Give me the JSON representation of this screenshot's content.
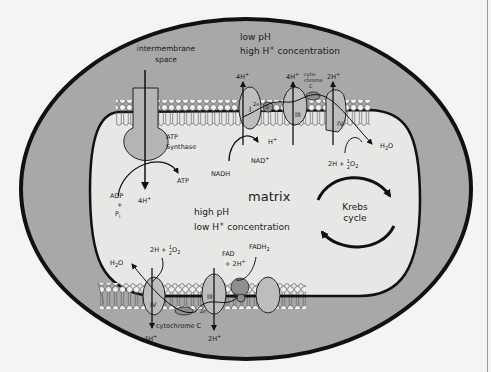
{
  "diagram": {
    "colors": {
      "background": "#f4f4f2",
      "outer_compartment": "#a8a8a8",
      "matrix": "#e6e6e4",
      "membrane_outline": "#111111",
      "protein_fill": "#bdbdbd",
      "protein_dark": "#8e8e8e"
    },
    "regions": {
      "intermembrane_line1": "intermembrane",
      "intermembrane_line2": "space",
      "top_ph": "low pH",
      "top_conc_prefix": "high H",
      "top_conc_sup": "+",
      "top_conc_suffix": " concentration",
      "matrix": "matrix",
      "matrix_ph": "high pH",
      "matrix_conc_prefix": "low H",
      "matrix_conc_sup": "+",
      "matrix_conc_suffix": " concentration"
    },
    "atp_synthase": {
      "label_line1": "ATP",
      "label_line2": "Synthase",
      "input_line1": "ADP",
      "input_line2": "+",
      "input_line3": "P",
      "input_sub": "i",
      "output": "ATP",
      "proton_in": "4H",
      "proton_sup": "+"
    },
    "top_chain": {
      "complex_1": "I",
      "complex_3": "III",
      "complex_4": "IV",
      "ubiquinone": "Q",
      "electrons": "2e",
      "cytochrome_line1": "cyto-",
      "cytochrome_line2": "chrome",
      "cytochrome_line3": "C",
      "pump_1": "4H",
      "pump_3": "4H",
      "pump_4": "2H",
      "sup": "+",
      "nadh": "NADH",
      "nad_plus": "NAD",
      "h_plus": "H",
      "water": "H",
      "water_sub": "2",
      "water_o": "O",
      "oxygen_prefix": "2H",
      "oxygen_mid": " + ",
      "half_num": "1",
      "half_den": "2",
      "o2": "O",
      "o2_sub": "2"
    },
    "bottom_chain": {
      "complex_2": "II",
      "complex_3": "III",
      "complex_4": "IV",
      "ubiquinone": "Q",
      "electrons": "2e",
      "cytochrome": "cytochrome C",
      "pump_4": "4H",
      "pump_3": "2H",
      "sup": "+",
      "fad_line1": "FAD",
      "fad_line2": "+ 2H",
      "fadh2": "FADH",
      "fadh2_sub": "2",
      "water": "H",
      "water_sub": "2",
      "water_o": "O",
      "oxygen_prefix": "2H",
      "oxygen_mid": " + ",
      "half_num": "1",
      "half_den": "2",
      "o2": "O",
      "o2_sub": "2"
    },
    "krebs": {
      "line1": "Krebs",
      "line2": "cycle"
    }
  }
}
